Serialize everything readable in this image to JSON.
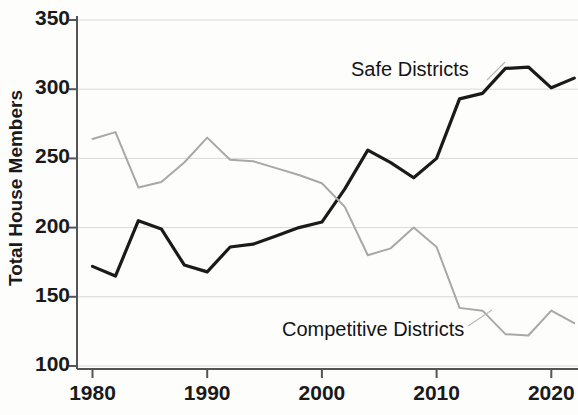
{
  "chart_data": {
    "type": "line",
    "title": "",
    "xlabel": "",
    "ylabel": "Total House Members",
    "xlim": [
      1979,
      2023
    ],
    "ylim": [
      100,
      350
    ],
    "xticks": [
      1980,
      1990,
      2000,
      2010,
      2020
    ],
    "yticks": [
      100,
      150,
      200,
      250,
      300,
      350
    ],
    "grid": true,
    "grid_axis": "y",
    "legend_position": "inline-annotations",
    "series": [
      {
        "name": "Safe Districts",
        "color": "#1a1a1a",
        "linewidth": 3.2,
        "annotation": "Safe Districts",
        "x": [
          1980,
          1982,
          1984,
          1986,
          1988,
          1990,
          1992,
          1994,
          1996,
          1998,
          2000,
          2002,
          2004,
          2006,
          2008,
          2010,
          2012,
          2014,
          2016,
          2018,
          2020,
          2022
        ],
        "values": [
          172,
          165,
          205,
          199,
          173,
          168,
          186,
          188,
          194,
          200,
          204,
          228,
          256,
          247,
          236,
          250,
          293,
          297,
          315,
          316,
          301,
          308
        ]
      },
      {
        "name": "Competitive Districts",
        "color": "#a8a8a8",
        "linewidth": 2.0,
        "annotation": "Competitive Districts",
        "x": [
          1980,
          1982,
          1984,
          1986,
          1988,
          1990,
          1992,
          1994,
          1996,
          1998,
          2000,
          2002,
          2004,
          2006,
          2008,
          2010,
          2012,
          2014,
          2016,
          2018,
          2020,
          2022
        ],
        "values": [
          264,
          269,
          229,
          233,
          247,
          265,
          249,
          248,
          243,
          238,
          232,
          215,
          180,
          185,
          200,
          186,
          142,
          140,
          123,
          122,
          140,
          131
        ]
      }
    ]
  },
  "axes": {
    "ylabel": "Total House Members",
    "ytick_labels": [
      "350",
      "300",
      "250",
      "200",
      "150",
      "100"
    ],
    "xtick_labels": [
      "1980",
      "1990",
      "2000",
      "2010",
      "2020"
    ]
  },
  "annotations": {
    "safe": "Safe Districts",
    "competitive": "Competitive Districts"
  },
  "colors": {
    "safe_line": "#1a1a1a",
    "competitive_line": "#a8a8a8",
    "grid": "#d8d8d8",
    "axis": "#555555",
    "background": "#fdfdfc",
    "text": "#1a1a1a"
  }
}
